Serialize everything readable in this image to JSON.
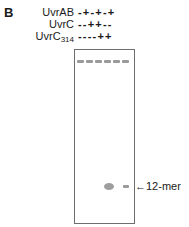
{
  "panel": {
    "letter": "B"
  },
  "rows": [
    {
      "label": "UvrAB",
      "sub": "",
      "signs": "-+-+-+"
    },
    {
      "label": "UvrC",
      "sub": "",
      "signs": "--++--"
    },
    {
      "label": "UvrC",
      "sub": "314",
      "signs": "----++"
    }
  ],
  "gel": {
    "lanes": 6,
    "top_band_lanes": [
      1,
      2,
      3,
      4,
      5,
      6
    ],
    "product_bands": [
      {
        "lane": 4,
        "type": "large-spot"
      },
      {
        "lane": 6,
        "type": "small-band"
      }
    ],
    "marker_label": "←12-mer"
  }
}
